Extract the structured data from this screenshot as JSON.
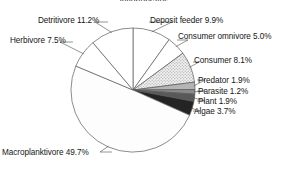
{
  "figure": {
    "title": "Invertebrates",
    "title_clipped": true,
    "background": "#ffffff",
    "outline_color": "#5a5a5a"
  },
  "chart_data": {
    "type": "pie",
    "title": "Invertebrates",
    "xlabel": "",
    "ylabel": "",
    "legend_position": "none",
    "labels_with_leader_lines": true,
    "start_angle_deg": 0,
    "direction": "clockwise",
    "categories": [
      "Deposit feeder",
      "Consumer omnivore",
      "Consumer",
      "Predator",
      "Parasite",
      "Plant",
      "Algae",
      "Macroplanktivore",
      "Herbivore",
      "Detritivore"
    ],
    "values": [
      9.9,
      5.0,
      8.1,
      1.9,
      1.2,
      1.9,
      3.7,
      49.7,
      7.5,
      11.2
    ],
    "units": "percent",
    "slice_fills": [
      "#ffffff",
      "#ffffff",
      "#e2e2e2",
      "#b4b4b4",
      "#8a8a8a",
      "#595959",
      "#242424",
      "#fdfdfd",
      "#ffffff",
      "#ffffff"
    ],
    "data_labels": [
      "Deposit feeder 9.9%",
      "Consumer omnivore 5.0%",
      "Consumer 8.1%",
      "Predator 1.9%",
      "Parasite 1.2%",
      "Plant 1.9%",
      "Algae 3.7%",
      "Macroplanktivore 49.7%",
      "Herbivore 7.5%",
      "Detritivore 11.2%"
    ]
  },
  "labels": {
    "deposit_feeder": "Deposit feeder 9.9%",
    "consumer_omnivore": "Consumer omnivore 5.0%",
    "consumer": "Consumer 8.1%",
    "predator": "Predator 1.9%",
    "parasite": "Parasite 1.2%",
    "plant": "Plant 1.9%",
    "algae": "Algae 3.7%",
    "macroplanktivore": "Macroplanktivore 49.7%",
    "herbivore": "Herbivore 7.5%",
    "detritivore": "Detritivore 11.2%"
  }
}
